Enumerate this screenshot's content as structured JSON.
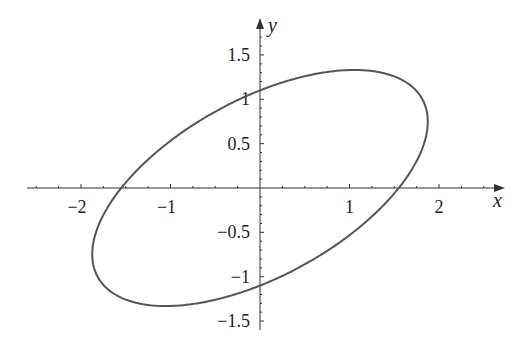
{
  "chart_data": {
    "type": "line",
    "title": "",
    "xlabel": "x",
    "ylabel": "y",
    "equation_coefficients": {
      "a": 0.416,
      "b": -0.659,
      "c": 0.826
    },
    "xlim": [
      -2.6,
      2.7
    ],
    "ylim": [
      -1.6,
      1.9
    ],
    "x_ticks": [
      -2,
      -1,
      1,
      2
    ],
    "x_tick_labels": [
      "−2",
      "−1",
      "1",
      "2"
    ],
    "x_minor_step": 0.25,
    "y_ticks": [
      1.5,
      1,
      0.5,
      -0.5,
      -1,
      -1.5
    ],
    "y_tick_labels": [
      "1.5",
      "1",
      "0.5",
      "−0.5",
      "−1",
      "−1.5"
    ],
    "y_minor_step": 0.1,
    "grid": false,
    "legend": null,
    "key_points": {
      "top": [
        1.03,
        1.3
      ],
      "bottom": [
        -0.97,
        -1.32
      ],
      "rightmost": [
        1.82,
        0.7
      ],
      "leftmost": [
        -1.81,
        -0.72
      ],
      "x_intercepts": [
        -1.55,
        1.55
      ],
      "y_intercepts": [
        -1.1,
        1.1
      ]
    },
    "series": [
      {
        "name": "ellipse",
        "color": "#555555"
      }
    ]
  },
  "axes": {
    "x_label": "x",
    "y_label": "y",
    "color": "#333333"
  }
}
